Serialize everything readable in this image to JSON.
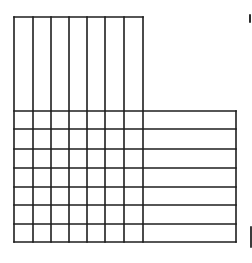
{
  "diagram": {
    "type": "grid-overlap",
    "stroke_color": "#1e1e1e",
    "background_color": "#ffffff",
    "vertical_strips": {
      "count": 7,
      "x_lines": [
        14,
        33,
        51,
        69,
        87,
        105,
        124,
        143
      ],
      "top": 17,
      "bottom": 242
    },
    "horizontal_strips": {
      "count": 7,
      "y_lines": [
        111,
        129,
        149,
        168,
        187,
        205,
        224,
        242
      ],
      "left": 14,
      "right": 236
    },
    "overlap_cells": {
      "rows": 7,
      "cols": 7,
      "total": 49
    }
  }
}
